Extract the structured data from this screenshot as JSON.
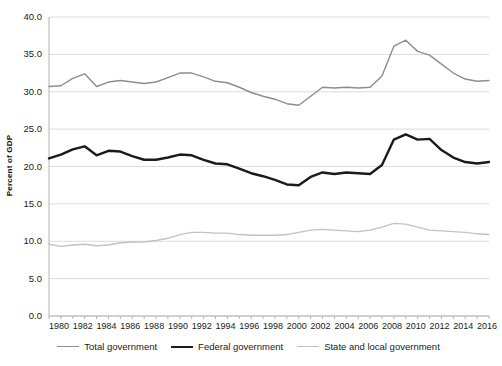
{
  "chart_data": {
    "type": "line",
    "title": "",
    "xlabel": "",
    "ylabel": "Percent of GDP",
    "xlim": [
      1980,
      2017
    ],
    "ylim": [
      0.0,
      40.0
    ],
    "grid": true,
    "legend_position": "bottom",
    "x": [
      1980,
      1981,
      1982,
      1983,
      1984,
      1985,
      1986,
      1987,
      1988,
      1989,
      1990,
      1991,
      1992,
      1993,
      1994,
      1995,
      1996,
      1997,
      1998,
      1999,
      2000,
      2001,
      2002,
      2003,
      2004,
      2005,
      2006,
      2007,
      2008,
      2009,
      2010,
      2011,
      2012,
      2013,
      2014,
      2015,
      2016,
      2017
    ],
    "xticks": [
      "1980",
      "1982",
      "1984",
      "1986",
      "1988",
      "1990",
      "1992",
      "1994",
      "1996",
      "1998",
      "2000",
      "2002",
      "2004",
      "2006",
      "2008",
      "2010",
      "2012",
      "2014",
      "2016"
    ],
    "yticks": [
      "0.0",
      "5.0",
      "10.0",
      "15.0",
      "20.0",
      "25.0",
      "30.0",
      "35.0",
      "40.0"
    ],
    "series": [
      {
        "name": "Total government",
        "color": "#8d8d8d",
        "width": 1.4,
        "values": [
          30.7,
          30.8,
          31.8,
          32.4,
          30.7,
          31.3,
          31.5,
          31.3,
          31.1,
          31.3,
          31.9,
          32.5,
          32.5,
          32.0,
          31.4,
          31.2,
          30.6,
          29.9,
          29.4,
          29.0,
          28.4,
          28.2,
          29.4,
          30.6,
          30.5,
          30.6,
          30.5,
          30.6,
          32.1,
          36.1,
          36.9,
          35.4,
          34.9,
          33.7,
          32.5,
          31.7,
          31.4,
          31.5
        ]
      },
      {
        "name": "Federal government",
        "color": "#1b1b1b",
        "width": 2.4,
        "values": [
          21.1,
          21.6,
          22.3,
          22.7,
          21.5,
          22.1,
          22.0,
          21.4,
          20.9,
          20.9,
          21.2,
          21.6,
          21.5,
          20.9,
          20.4,
          20.3,
          19.7,
          19.1,
          18.7,
          18.2,
          17.6,
          17.5,
          18.6,
          19.2,
          19.0,
          19.2,
          19.1,
          19.0,
          20.2,
          23.6,
          24.3,
          23.6,
          23.7,
          22.2,
          21.2,
          20.6,
          20.4,
          20.6
        ]
      },
      {
        "name": "State and local government",
        "color": "#c2c2c2",
        "width": 1.3,
        "values": [
          9.6,
          9.3,
          9.5,
          9.6,
          9.4,
          9.5,
          9.8,
          9.9,
          9.9,
          10.1,
          10.4,
          10.9,
          11.2,
          11.2,
          11.1,
          11.1,
          10.9,
          10.8,
          10.8,
          10.8,
          10.9,
          11.2,
          11.5,
          11.6,
          11.5,
          11.4,
          11.3,
          11.5,
          11.9,
          12.4,
          12.3,
          11.9,
          11.5,
          11.4,
          11.3,
          11.2,
          11.0,
          10.9
        ]
      }
    ]
  },
  "legend": {
    "items": [
      {
        "label": "Total government"
      },
      {
        "label": "Federal government"
      },
      {
        "label": "State and local government"
      }
    ]
  }
}
